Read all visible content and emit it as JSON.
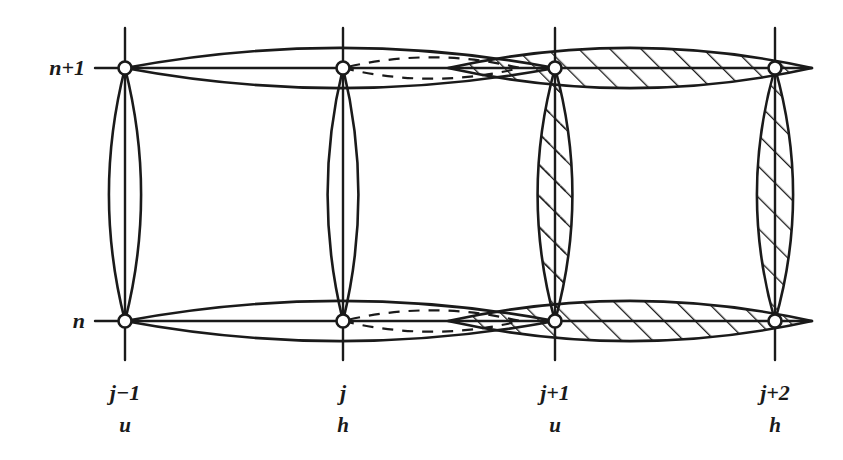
{
  "figure": {
    "background_color": "#ffffff",
    "ink_color": "#1a1a1a",
    "width": 843,
    "height": 460
  },
  "axes": {
    "row_label_top": "n+1",
    "row_label_bottom": "n",
    "rows": [
      {
        "name": "n+1",
        "label": "n+1",
        "y": 68
      },
      {
        "name": "n",
        "label": "n",
        "y": 321
      }
    ],
    "columns": [
      {
        "name": "j-1",
        "label": "j−1",
        "sub": "u",
        "x": 125
      },
      {
        "name": "j",
        "label": "j",
        "sub": "h",
        "x": 343
      },
      {
        "name": "j+1",
        "label": "j+1",
        "sub": "u",
        "x": 555
      },
      {
        "name": "j+2",
        "label": "j+2",
        "sub": "h",
        "x": 775
      }
    ]
  },
  "grid": {
    "vertical_line_top": 28,
    "vertical_line_bottom": 360,
    "horizontal_line_left": 95,
    "horizontal_line_right": 812,
    "node_radius": 6.5
  },
  "nodes": [
    {
      "name": "node-j-1-n-plus-1",
      "x": 125,
      "y": 68
    },
    {
      "name": "node-j-n-plus-1",
      "x": 343,
      "y": 68
    },
    {
      "name": "node-j-plus-1-n-plus-1",
      "x": 555,
      "y": 68
    },
    {
      "name": "node-j-plus-2-n-plus-1",
      "x": 775,
      "y": 68
    },
    {
      "name": "node-j-1-n",
      "x": 125,
      "y": 321
    },
    {
      "name": "node-j-n",
      "x": 343,
      "y": 321
    },
    {
      "name": "node-j-plus-1-n",
      "x": 555,
      "y": 321
    },
    {
      "name": "node-j-plus-2-n",
      "x": 775,
      "y": 321
    }
  ],
  "vertical_lenses": [
    {
      "name": "vertical-lens-j-1",
      "x": 125,
      "y_top": 68,
      "y_bottom": 321,
      "half_width": 24,
      "fill": "none"
    },
    {
      "name": "vertical-lens-j",
      "x": 343,
      "y_top": 68,
      "y_bottom": 321,
      "half_width": 23,
      "fill": "none"
    },
    {
      "name": "vertical-lens-j-plus-1",
      "x": 555,
      "y_top": 68,
      "y_bottom": 321,
      "half_width": 26,
      "fill": "hatch-double"
    },
    {
      "name": "vertical-lens-j-plus-2",
      "x": 775,
      "y_top": 68,
      "y_bottom": 321,
      "half_width": 27,
      "fill": "hatch-solid"
    }
  ],
  "horizontal_lenses": [
    {
      "name": "horizontal-lens-top-plain",
      "row": "n+1",
      "x_left": 125,
      "x_right": 555,
      "y": 68,
      "half_height": 30,
      "fill": "none"
    },
    {
      "name": "horizontal-lens-top-hatched",
      "row": "n+1",
      "x_left": 448,
      "x_right": 812,
      "y": 68,
      "half_height": 30,
      "fill": "hatch-solid"
    },
    {
      "name": "horizontal-lens-top-dashed",
      "row": "n+1",
      "x_left": 343,
      "x_right": 520,
      "y": 68,
      "half_height": 16,
      "fill": "none",
      "stroke": "dashed"
    },
    {
      "name": "horizontal-lens-bottom-plain",
      "row": "n",
      "x_left": 125,
      "x_right": 555,
      "y": 321,
      "half_height": 30,
      "fill": "none"
    },
    {
      "name": "horizontal-lens-bottom-hatched",
      "row": "n",
      "x_left": 448,
      "x_right": 812,
      "y": 321,
      "half_height": 30,
      "fill": "hatch-solid"
    },
    {
      "name": "horizontal-lens-bottom-dashed",
      "row": "n",
      "x_left": 343,
      "x_right": 520,
      "y": 321,
      "half_height": 16,
      "fill": "none",
      "stroke": "dashed"
    }
  ],
  "hatching": {
    "angle_description": "lower-left to upper-right, 45 degrees",
    "solid_spacing_px": 22,
    "dashed_spacing_px": 22,
    "line_color": "#1a1a1a"
  }
}
